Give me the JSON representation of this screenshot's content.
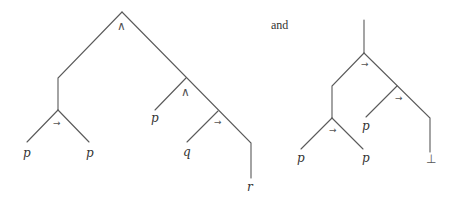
{
  "connector_text": "and",
  "trees": [
    {
      "name": "left-tree",
      "formula_structure": "(p → p) ∧ (p ∧ (q → r))",
      "nodes": [
        {
          "id": "root",
          "label": "∧"
        },
        {
          "id": "impl1",
          "label": "→"
        },
        {
          "id": "leaf_p1",
          "label": "p"
        },
        {
          "id": "leaf_p2",
          "label": "p"
        },
        {
          "id": "and2",
          "label": "∧"
        },
        {
          "id": "leaf_p3",
          "label": "p"
        },
        {
          "id": "impl2",
          "label": "→"
        },
        {
          "id": "leaf_q",
          "label": "q"
        },
        {
          "id": "leaf_r",
          "label": "r"
        }
      ]
    },
    {
      "name": "right-tree",
      "formula_structure": "(p → p) → (p → ⊥)",
      "nodes": [
        {
          "id": "root",
          "label": "→"
        },
        {
          "id": "impl1",
          "label": "→"
        },
        {
          "id": "leaf_p1",
          "label": "p"
        },
        {
          "id": "leaf_p2",
          "label": "p"
        },
        {
          "id": "impl2",
          "label": "→"
        },
        {
          "id": "leaf_p3",
          "label": "p"
        },
        {
          "id": "leaf_bottom",
          "label": "⊥"
        }
      ]
    }
  ],
  "labels": {
    "t1_root": "∧",
    "t1_impl1": "→",
    "t1_p1": "p",
    "t1_p2": "p",
    "t1_and2": "∧",
    "t1_p3": "p",
    "t1_impl2": "→",
    "t1_q": "q",
    "t1_r": "r",
    "t2_root": "→",
    "t2_impl1": "→",
    "t2_p1": "p",
    "t2_p2": "p",
    "t2_impl2": "→",
    "t2_p3": "p",
    "t2_bottom": "⊥"
  }
}
